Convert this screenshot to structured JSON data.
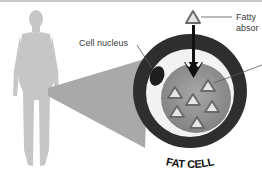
{
  "diagram": {
    "labels": {
      "cell_nucleus": "Cell nucleus",
      "fatty_line1": "Fatty",
      "fatty_line2": "absor",
      "fat_cell": "FAT CELL"
    },
    "colors": {
      "silhouette": "#c4c4c4",
      "cone": "#a9a9a9",
      "cell_ring": "#2e2e2e",
      "cell_inner_ring": "#f2f2f2",
      "cytoplasm": "#8f8f8f",
      "nucleus": "#1e1e1e",
      "triangle_fill": "#e6e6e6",
      "triangle_stroke": "#6a6a6a",
      "arrow": "#111111"
    },
    "triangle_count": 6
  }
}
